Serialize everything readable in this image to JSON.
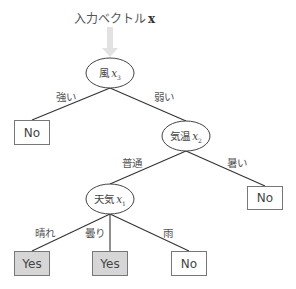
{
  "title": {
    "text": "入力ベクトル",
    "vector_symbol": "x"
  },
  "nodes": [
    {
      "id": "wind",
      "label": "風",
      "var": "x",
      "sub": "3",
      "cx": 110,
      "cy": 73
    },
    {
      "id": "temp",
      "label": "気温",
      "var": "x",
      "sub": "2",
      "cx": 186,
      "cy": 136
    },
    {
      "id": "weather",
      "label": "天気",
      "var": "x",
      "sub": "1",
      "cx": 110,
      "cy": 199
    }
  ],
  "edges": [
    {
      "from": "wind",
      "to": "leaf-no-1",
      "label": "強い"
    },
    {
      "from": "wind",
      "to": "temp",
      "label": "弱い"
    },
    {
      "from": "temp",
      "to": "weather",
      "label": "普通"
    },
    {
      "from": "temp",
      "to": "leaf-no-2",
      "label": "暑い"
    },
    {
      "from": "weather",
      "to": "leaf-yes-1",
      "label": "晴れ"
    },
    {
      "from": "weather",
      "to": "leaf-yes-2",
      "label": "曇り"
    },
    {
      "from": "weather",
      "to": "leaf-no-3",
      "label": "雨"
    }
  ],
  "leaves": [
    {
      "id": "leaf-no-1",
      "label": "No",
      "class": "no"
    },
    {
      "id": "leaf-no-2",
      "label": "No",
      "class": "no"
    },
    {
      "id": "leaf-yes-1",
      "label": "Yes",
      "class": "yes"
    },
    {
      "id": "leaf-yes-2",
      "label": "Yes",
      "class": "yes"
    },
    {
      "id": "leaf-no-3",
      "label": "No",
      "class": "no"
    }
  ],
  "colors": {
    "line": "#333333",
    "arrow": "#dddddd",
    "yes_fill": "#d6d6d6",
    "box_border": "#777777"
  }
}
